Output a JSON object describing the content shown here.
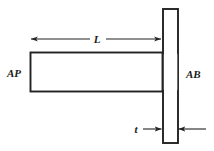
{
  "figure": {
    "type": "engineering-diagram",
    "background_color": "#ffffff",
    "stroke_color": "#222222",
    "text_color": "#1a1a1a"
  },
  "labels": {
    "beam": "AP",
    "plate": "AB",
    "length_dimension": "L",
    "thickness_dimension": "t"
  },
  "geometry": {
    "beam": {
      "x": 30,
      "y": 52,
      "width": 132,
      "height": 40
    },
    "plate": {
      "x": 162,
      "y": 8,
      "width": 16,
      "height": 135
    },
    "length_dim_line": {
      "y": 39,
      "x_start": 30,
      "x_end": 162
    },
    "thickness_dim_line": {
      "y": 129,
      "x_left_start": 142,
      "x_left_end": 162,
      "x_right_start": 205,
      "x_right_end": 178
    }
  }
}
